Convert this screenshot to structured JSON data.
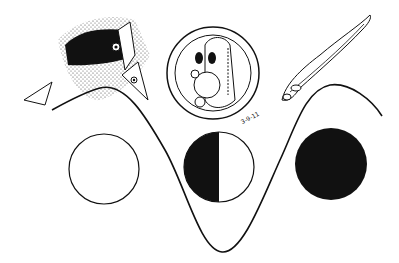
{
  "figure": {
    "background": "#ffffff",
    "ink": "#111111",
    "illustrations": [
      {
        "id": "fish-pair",
        "description": "Two fish heads emerging from a stippled dark mass (spawning adults)"
      },
      {
        "id": "egg",
        "description": "Fertilized egg containing a developing embryo with eyes and yolk"
      },
      {
        "id": "larva",
        "description": "Slender larval fish curving upward"
      }
    ],
    "egg_label": "3-9-11",
    "phase_circles": [
      {
        "id": "circle-empty",
        "fill": "none"
      },
      {
        "id": "circle-half",
        "fill": "left-half"
      },
      {
        "id": "circle-full",
        "fill": "full"
      }
    ],
    "curve": "sinusoidal wave rising at left, dipping at center, rising at right"
  }
}
